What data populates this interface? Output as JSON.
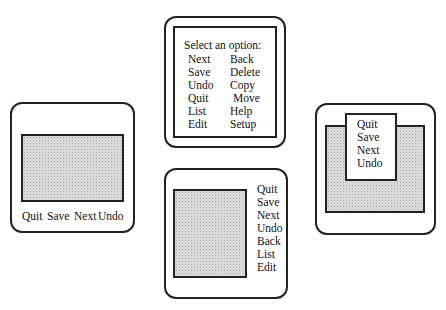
{
  "panels": {
    "top": {
      "prompt": "Select an option:",
      "left_column": [
        "Next",
        "Save",
        "Undo",
        "Quit",
        "List",
        "Edit"
      ],
      "right_column": [
        "Back",
        "Delete",
        "Copy",
        "Move",
        "Help",
        "Setup"
      ]
    },
    "left": {
      "menu_bar": [
        "Quit",
        "Save",
        "Next",
        "Undo"
      ]
    },
    "bottom": {
      "side_menu": [
        "Quit",
        "Save",
        "Next",
        "Undo",
        "Back",
        "List",
        "Edit"
      ]
    },
    "right": {
      "popup_menu": [
        "Quit",
        "Save",
        "Next",
        "Undo"
      ]
    }
  },
  "colors": {
    "stroke": "#222222",
    "fill_gray": "#d9d9d9",
    "background": "#ffffff"
  }
}
